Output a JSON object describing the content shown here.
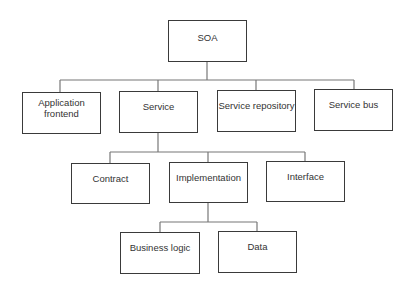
{
  "diagram": {
    "type": "tree",
    "root": {
      "label": "SOA",
      "children": [
        {
          "label": "Application frontend",
          "line1": "Application",
          "line2": "frontend"
        },
        {
          "label": "Service",
          "children": [
            {
              "label": "Contract"
            },
            {
              "label": "Implementation",
              "children": [
                {
                  "label": "Business logic"
                },
                {
                  "label": "Data"
                }
              ]
            },
            {
              "label": "Interface"
            }
          ]
        },
        {
          "label": "Service repository"
        },
        {
          "label": "Service bus"
        }
      ]
    },
    "nodes": {
      "soa": "SOA",
      "app_frontend_line1": "Application",
      "app_frontend_line2": "frontend",
      "service": "Service",
      "service_repository": "Service repository",
      "service_bus": "Service bus",
      "contract": "Contract",
      "implementation": "Implementation",
      "interface": "Interface",
      "business_logic": "Business logic",
      "data": "Data"
    },
    "colors": {
      "border": "#3a3a3a",
      "connector": "#777777",
      "text": "#333333",
      "background": "#ffffff"
    }
  }
}
